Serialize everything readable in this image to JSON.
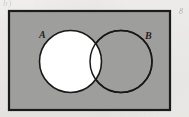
{
  "figure": {
    "kind": "venn-diagram",
    "caption_artifact_left": "b)",
    "caption_artifact_right": "8",
    "background_color": "#f1f0ee",
    "universe": {
      "name": "universal-set-rectangle",
      "fill_color": "#9e9e9c",
      "stroke_color": "#1d1b19",
      "x": 9,
      "y": 11,
      "width": 161,
      "height": 99,
      "stroke_width": 2.2
    },
    "sets": [
      {
        "id": "A",
        "label": "A",
        "name": "set-a-circle",
        "cx": 70.5,
        "cy": 61.5,
        "r": 31,
        "fill_color": "#ffffff",
        "stroke_color": "#1b1917",
        "stroke_width": 1.6,
        "shaded": false,
        "label_x": 39,
        "label_y": 30
      },
      {
        "id": "B",
        "label": "B",
        "name": "set-b-circle",
        "cx": 121,
        "cy": 61.5,
        "r": 31,
        "fill_color": "#9e9e9c",
        "stroke_color": "#1b1917",
        "stroke_width": 1.6,
        "shaded": true,
        "label_x": 145,
        "label_y": 31
      }
    ],
    "regions": {
      "intersection_fill": "#ffffff",
      "a_only_fill": "#ffffff",
      "b_only_fill": "#9e9e9c",
      "outside_fill": "#9e9e9c",
      "shaded_description": "Everything outside circle A is shaded; circle A including the intersection with B is unshaded (white)."
    }
  }
}
